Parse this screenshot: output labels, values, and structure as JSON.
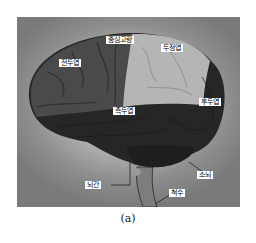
{
  "figure": {
    "caption": "(a)",
    "colors": {
      "background_frame": "#8a8a8a",
      "halo": "#d4d4d4",
      "frontal_lobe": "#4a4a4a",
      "parietal_lobe": "#b5b5b5",
      "temporal_lobe": "#262626",
      "occipital_lobe": "#2a2a2a",
      "cerebellum": "#1e1e1e",
      "brainstem": "#7d7d7d",
      "label_bg": "#ffffff"
    },
    "labels": [
      {
        "id": "central-sulcus",
        "text": "중심고랑"
      },
      {
        "id": "parietal-lobe",
        "text": "두정엽"
      },
      {
        "id": "frontal-lobe",
        "text": "전두엽"
      },
      {
        "id": "temporal-lobe",
        "text": "측두엽"
      },
      {
        "id": "occipital-lobe",
        "text": "후두엽"
      },
      {
        "id": "cerebellum",
        "text": "소뇌"
      },
      {
        "id": "brainstem",
        "text": "뇌간"
      },
      {
        "id": "spinal-cord",
        "text": "척수"
      }
    ]
  }
}
